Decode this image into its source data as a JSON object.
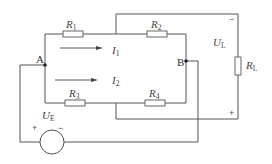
{
  "diagram": {
    "type": "circuit-schematic",
    "nodes": [
      {
        "id": "A",
        "label": "A"
      },
      {
        "id": "B",
        "label": "B"
      }
    ],
    "resistors": [
      {
        "id": "R1",
        "label": "R",
        "sub": "1"
      },
      {
        "id": "R2",
        "label": "R",
        "sub": "2"
      },
      {
        "id": "R3",
        "label": "R",
        "sub": "3"
      },
      {
        "id": "R4",
        "label": "R",
        "sub": "4"
      },
      {
        "id": "RL",
        "label": "R",
        "sub": "L"
      }
    ],
    "currents": [
      {
        "id": "I1",
        "label": "I",
        "sub": "1"
      },
      {
        "id": "I2",
        "label": "I",
        "sub": "2"
      }
    ],
    "voltages": [
      {
        "id": "UL",
        "label": "U",
        "sub": "L",
        "plus": "+",
        "minus": "−"
      },
      {
        "id": "UE",
        "label": "U",
        "sub": "E",
        "plus": "+",
        "minus": "−"
      }
    ],
    "colors": {
      "wire": "#555555",
      "text": "#444444",
      "background": "#ffffff"
    }
  }
}
